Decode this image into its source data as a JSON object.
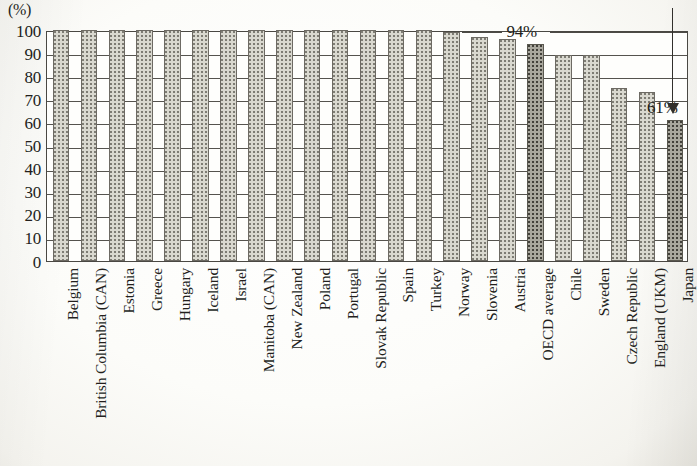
{
  "axis": {
    "unit_label": "(%)",
    "y_ticks": [
      "100",
      "90",
      "80",
      "70",
      "60",
      "50",
      "40",
      "30",
      "20",
      "10",
      "0"
    ]
  },
  "annotations": {
    "oecd_average_label": "94%",
    "japan_label": "61%",
    "arrow_icon": "down-arrow-icon"
  },
  "colors": {
    "bar_light": "#d9d8cf",
    "bar_dark": "#a9a79d",
    "ink": "#231f1c",
    "paper": "#fdfdfb"
  },
  "chart_data": {
    "type": "bar",
    "title": "",
    "subtitle": "",
    "xlabel": "",
    "ylabel": "(%)",
    "ylim": [
      0,
      100
    ],
    "ytick_step": 10,
    "grid": true,
    "legend": "none",
    "orientation": "vertical",
    "categories": [
      "Belgium",
      "British Columbia (CAN)",
      "Estonia",
      "Greece",
      "Hungary",
      "Iceland",
      "Israel",
      "Manitoba (CAN)",
      "New Zealand",
      "Poland",
      "Portugal",
      "Slovak Republic",
      "Spain",
      "Turkey",
      "Norway",
      "Slovenia",
      "Austria",
      "OECD average",
      "Chile",
      "Sweden",
      "Czech Republic",
      "England (UKM)",
      "Japan"
    ],
    "values": [
      100,
      100,
      100,
      100,
      100,
      100,
      100,
      100,
      100,
      100,
      100,
      100,
      100,
      100,
      99,
      97,
      96,
      94,
      89,
      89,
      75,
      73,
      61
    ],
    "highlighted": [
      "OECD average",
      "Japan"
    ],
    "data_labels": [
      {
        "category": "OECD average",
        "text": "94%"
      },
      {
        "category": "Japan",
        "text": "61%"
      }
    ]
  }
}
